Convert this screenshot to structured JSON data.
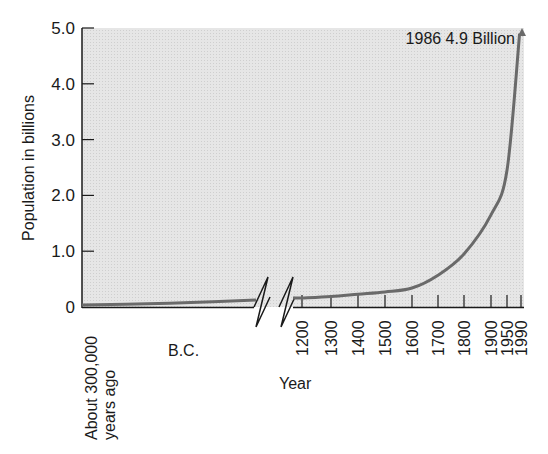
{
  "chart_data": {
    "type": "line",
    "title": "",
    "xlabel": "Year",
    "ylabel": "Population in billions",
    "ylim": [
      0,
      5.0
    ],
    "y_ticks": [
      "0",
      "1.0",
      "2.0",
      "3.0",
      "4.0",
      "5.0"
    ],
    "y_tick_values": [
      0,
      1,
      2,
      3,
      4,
      5
    ],
    "grid": false,
    "legend": null,
    "axis_break": true,
    "bc_segment": {
      "label_start": "About 300,000",
      "label_start_line2": "years ago",
      "label_mid": "B.C.",
      "x": [
        "About 300,000 years ago",
        "B.C. end"
      ],
      "values": [
        0.0,
        0.1
      ]
    },
    "x_ticks": [
      "1200",
      "1300",
      "1400",
      "1500",
      "1600",
      "1700",
      "1800",
      "1900",
      "1950",
      "1990"
    ],
    "series": [
      {
        "name": "World population",
        "x": [
          1200,
          1300,
          1400,
          1500,
          1600,
          1700,
          1800,
          1900,
          1950,
          1986
        ],
        "values": [
          0.16,
          0.19,
          0.23,
          0.27,
          0.34,
          0.57,
          0.95,
          1.65,
          2.45,
          4.9
        ]
      }
    ],
    "annotations": [
      {
        "text": "1986 4.9 Billion",
        "x": 1986,
        "y": 4.9
      }
    ],
    "colors": {
      "plot_background": "#e4e4e4",
      "curve": "#6a6a6a",
      "axis": "#1a1a1a"
    }
  }
}
